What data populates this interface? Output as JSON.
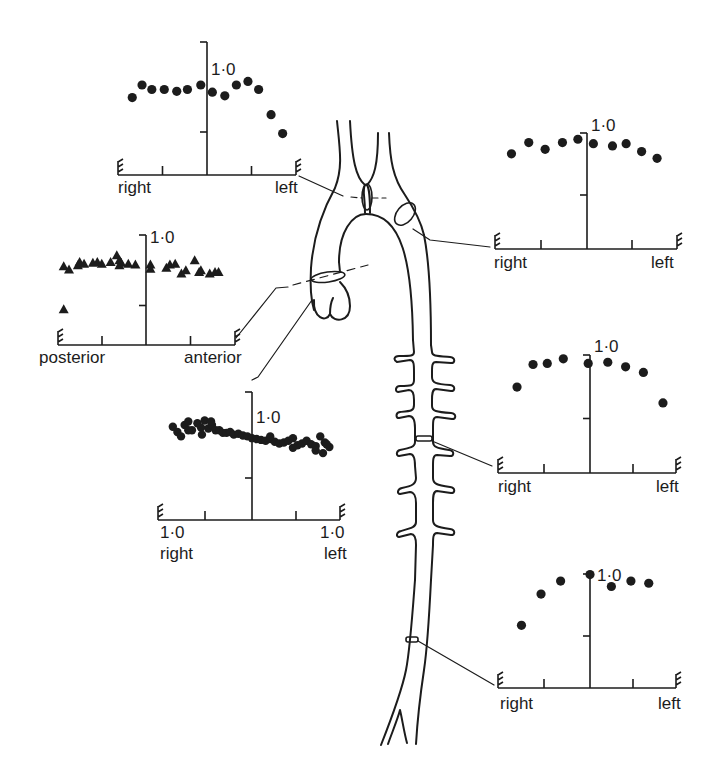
{
  "figure": {
    "ink_color": "#1c1c1c",
    "background": "#ffffff"
  },
  "panels": [
    {
      "id": "aortic-arch-proximal",
      "y_label": "1·0",
      "x_left": "right",
      "x_right": "left",
      "marker": "circle"
    },
    {
      "id": "aortic-arch-distal",
      "y_label": "1·0",
      "x_left": "right",
      "x_right": "left",
      "marker": "circle"
    },
    {
      "id": "aortic-root",
      "y_label": "1·0",
      "x_left": "posterior",
      "x_right": "anterior",
      "marker": "triangle"
    },
    {
      "id": "ascending-aorta",
      "y_label": "1·0",
      "x_left": "right",
      "x_right": "left",
      "x_left_value": "1·0",
      "x_right_value": "1·0",
      "marker": "circle"
    },
    {
      "id": "descending-thoracic",
      "y_label": "1·0",
      "x_left": "right",
      "x_right": "left",
      "marker": "circle"
    },
    {
      "id": "abdominal-aorta",
      "y_label": "1·0",
      "x_left": "right",
      "x_right": "left",
      "marker": "circle"
    }
  ],
  "chart_data": [
    {
      "type": "scatter",
      "title": "Velocity profile – aortic arch (between brachiocephalic branches)",
      "xlabel": "right ← position → left",
      "ylabel": "normalised velocity",
      "ylim": [
        0,
        1.1
      ],
      "xlim": [
        -1,
        1
      ],
      "yticks": [
        "0.5",
        "1·0"
      ],
      "x": [
        -0.84,
        -0.73,
        -0.62,
        -0.48,
        -0.34,
        -0.22,
        -0.07,
        0.06,
        0.2,
        0.33,
        0.46,
        0.58,
        0.72,
        0.85
      ],
      "y": [
        0.86,
        1.0,
        0.95,
        0.95,
        0.93,
        0.95,
        1.0,
        0.92,
        0.88,
        1.0,
        1.04,
        0.95,
        0.67,
        0.46
      ]
    },
    {
      "type": "scatter",
      "title": "Velocity profile – distal arch",
      "xlabel": "right ← position → left",
      "ylabel": "normalised velocity",
      "ylim": [
        0,
        1.1
      ],
      "xlim": [
        -1,
        1
      ],
      "yticks": [
        "0.5",
        "1·0"
      ],
      "x": [
        -0.83,
        -0.64,
        -0.46,
        -0.27,
        -0.1,
        0.07,
        0.28,
        0.43,
        0.6,
        0.77
      ],
      "y": [
        0.85,
        0.95,
        0.89,
        0.95,
        0.98,
        0.94,
        0.92,
        0.94,
        0.87,
        0.81
      ]
    },
    {
      "type": "scatter",
      "title": "Velocity profile – aortic root",
      "xlabel": "posterior ← position → anterior",
      "ylabel": "normalised velocity",
      "ylim": [
        0,
        1.1
      ],
      "xlim": [
        -1,
        1
      ],
      "yticks": [
        "0.5",
        "1·0"
      ],
      "marker": "triangle",
      "x": [
        -0.93,
        -0.87,
        -0.77,
        -0.75,
        -0.7,
        -0.6,
        -0.55,
        -0.5,
        -0.4,
        -0.33,
        -0.3,
        -0.28,
        -0.2,
        -0.12,
        -0.93,
        0.05,
        0.05,
        0.23,
        0.27,
        0.33,
        0.4,
        0.45,
        0.55,
        0.6,
        0.62,
        0.72,
        0.78,
        0.82,
        -0.3
      ],
      "y": [
        0.95,
        0.91,
        0.96,
        1.0,
        0.98,
        0.99,
        1.0,
        0.98,
        1.0,
        1.08,
        0.96,
        0.99,
        0.98,
        0.97,
        0.43,
        0.97,
        0.92,
        0.93,
        0.97,
        0.98,
        0.86,
        0.9,
        1.02,
        0.88,
        0.9,
        0.86,
        0.88,
        0.88,
        1.02
      ]
    },
    {
      "type": "scatter",
      "title": "Velocity profile – ascending aorta (multiple runs)",
      "xlabel": "right ← position → left",
      "ylabel": "normalised velocity",
      "ylim": [
        0,
        1.1
      ],
      "xlim": [
        -1,
        1
      ],
      "xticks": [
        "1·0",
        "1·0"
      ],
      "yticks": [
        "0.5",
        "1·0"
      ],
      "x": [
        -0.87,
        -0.82,
        -0.78,
        -0.74,
        -0.7,
        -0.66,
        -0.6,
        -0.56,
        -0.52,
        -0.48,
        -0.44,
        -0.4,
        -0.36,
        -0.32,
        -0.28,
        -0.24,
        -0.2,
        -0.15,
        -0.1,
        -0.05,
        0.0,
        0.05,
        0.1,
        0.15,
        0.2,
        0.25,
        0.3,
        0.35,
        0.4,
        0.45,
        0.5,
        0.55,
        0.6,
        0.65,
        0.7,
        0.75,
        0.8,
        0.85,
        -0.7,
        -0.55,
        -0.45,
        0.2,
        0.45,
        0.7,
        0.78,
        0.82
      ],
      "y": [
        1.06,
        1.0,
        0.95,
        1.08,
        1.12,
        1.02,
        1.1,
        1.05,
        1.13,
        1.04,
        1.08,
        1.02,
        1.02,
        0.99,
        0.99,
        1.0,
        0.97,
        0.98,
        0.96,
        0.95,
        0.93,
        0.92,
        0.91,
        0.9,
        0.92,
        0.89,
        0.87,
        0.88,
        0.9,
        0.93,
        0.85,
        0.87,
        0.9,
        0.86,
        0.84,
        0.95,
        0.88,
        0.83,
        1.02,
        0.97,
        1.12,
        0.95,
        0.82,
        0.79,
        0.76,
        0.86
      ]
    },
    {
      "type": "scatter",
      "title": "Velocity profile – descending thoracic aorta",
      "xlabel": "right ← position → left",
      "ylabel": "normalised velocity",
      "ylim": [
        0,
        1.1
      ],
      "xlim": [
        -1,
        1
      ],
      "yticks": [
        "0.5",
        "1·0"
      ],
      "x": [
        -0.82,
        -0.64,
        -0.48,
        -0.3,
        -0.02,
        0.2,
        0.4,
        0.6,
        0.82
      ],
      "y": [
        0.76,
        0.96,
        0.97,
        1.01,
        0.97,
        0.98,
        0.94,
        0.89,
        0.62
      ]
    },
    {
      "type": "scatter",
      "title": "Velocity profile – abdominal aorta",
      "xlabel": "right ← position → left",
      "ylabel": "normalised velocity",
      "ylim": [
        0,
        1.1
      ],
      "xlim": [
        -1,
        1
      ],
      "yticks": [
        "0.5",
        "1·0"
      ],
      "x": [
        -0.77,
        -0.55,
        -0.33,
        0.0,
        0.24,
        0.46,
        0.66
      ],
      "y": [
        0.58,
        0.87,
        0.99,
        1.05,
        0.94,
        0.99,
        0.97
      ]
    }
  ]
}
